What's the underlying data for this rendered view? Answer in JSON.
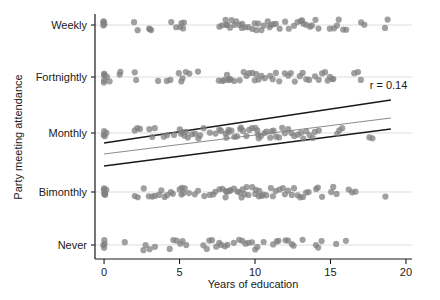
{
  "chart_data": {
    "type": "scatter",
    "title": "",
    "xlabel": "Years of education",
    "ylabel": "Party meeting attendance",
    "xlim": [
      -0.6,
      20.4
    ],
    "xticks": [
      0,
      5,
      10,
      15,
      20
    ],
    "xticklabels": [
      "0",
      "5",
      "10",
      "15",
      "20"
    ],
    "yticklabels": [
      "Weekly",
      "Fortnightly",
      "Monthly",
      "Bimonthly",
      "Never"
    ],
    "ycategories": [
      {
        "label": "Weekly",
        "code": 5
      },
      {
        "label": "Fortnightly",
        "code": 4
      },
      {
        "label": "Monthly",
        "code": 3
      },
      {
        "label": "Bimonthly",
        "code": 2
      },
      {
        "label": "Never",
        "code": 1
      }
    ],
    "grid": "horizontal-light",
    "legend": "none",
    "annotations": [
      {
        "text": "r = 0.14",
        "x": 17.6,
        "y_px": 89
      }
    ],
    "marker": {
      "shape": "circle",
      "color": "#808080",
      "opacity": 0.75,
      "radius_px": 3.1,
      "jitter": "vertical"
    },
    "lines": [
      {
        "name": "upper-band",
        "color": "#1a1a1a",
        "width": 1.6,
        "x": [
          0,
          19
        ],
        "y_px": [
          143,
          100
        ]
      },
      {
        "name": "fit-line",
        "color": "#8c8c8c",
        "width": 1.1,
        "x": [
          0,
          19
        ],
        "y_px": [
          154,
          118
        ]
      },
      {
        "name": "lower-band",
        "color": "#1a1a1a",
        "width": 1.6,
        "x": [
          0,
          19
        ],
        "y_px": [
          166,
          129
        ]
      }
    ],
    "series": [
      {
        "name": "Weekly",
        "y_category": "Weekly",
        "x": [
          0,
          0,
          0,
          0,
          2,
          2.2,
          3,
          3,
          3.1,
          4.4,
          4.8,
          5,
          5.1,
          5.2,
          5.3,
          7.6,
          7.8,
          8,
          8.1,
          8.2,
          8.3,
          8.4,
          8.6,
          8.8,
          9,
          9.1,
          9.2,
          9.4,
          9.6,
          9.8,
          10,
          10.1,
          10.2,
          10.4,
          10.6,
          10.8,
          11,
          11.1,
          11.2,
          11.4,
          11.6,
          12,
          12.2,
          12.6,
          12.8,
          13,
          13.1,
          13.2,
          13.4,
          13.6,
          13.8,
          14,
          14.2,
          15,
          15.2,
          15.4,
          15.6,
          15.8,
          16,
          17,
          17.2,
          18.6,
          18.8
        ]
      },
      {
        "name": "Fortnightly",
        "y_category": "Fortnightly",
        "x": [
          0,
          0,
          0,
          0,
          0,
          0.2,
          0.4,
          1,
          1.1,
          2,
          2.1,
          3.6,
          4.2,
          4.4,
          5,
          5.1,
          5.2,
          5.4,
          5.6,
          6.2,
          7.6,
          7.8,
          8,
          8.1,
          8.2,
          8.3,
          8.4,
          8.6,
          9,
          9.2,
          9.4,
          9.6,
          9.8,
          10,
          10.1,
          10.2,
          10.4,
          10.6,
          11,
          11.2,
          11.4,
          11.6,
          12,
          12.2,
          12.4,
          12.6,
          13,
          13.2,
          13.4,
          13.6,
          14,
          14.2,
          14.4,
          14.6,
          14.8,
          15,
          15.1,
          15.2,
          16.6,
          16.8,
          17
        ]
      },
      {
        "name": "Monthly",
        "y_category": "Monthly",
        "x": [
          0,
          0,
          0,
          0.2,
          2,
          2.2,
          2.4,
          3,
          3.2,
          3.4,
          4,
          4.2,
          4.6,
          5,
          5.1,
          5.2,
          5.3,
          5.4,
          5.6,
          5.8,
          6,
          6.2,
          6.4,
          6.6,
          7,
          7.4,
          7.6,
          7.8,
          8,
          8.1,
          8.2,
          8.3,
          8.4,
          8.6,
          8.8,
          9,
          9.1,
          9.2,
          9.4,
          9.6,
          9.8,
          10,
          10.1,
          10.2,
          10.3,
          10.4,
          10.6,
          10.8,
          11,
          11.1,
          11.2,
          11.4,
          11.6,
          11.8,
          12,
          12.2,
          12.4,
          12.6,
          12.8,
          13,
          13.2,
          13.4,
          13.6,
          13.8,
          14,
          14.2,
          15.4,
          15.6,
          15.8,
          17.6,
          17.8
        ]
      },
      {
        "name": "Bimonthly",
        "y_category": "Bimonthly",
        "x": [
          0,
          0,
          0,
          0,
          0,
          0.1,
          0.2,
          2,
          2.2,
          2.6,
          3,
          3.2,
          3.4,
          3.6,
          3.8,
          4,
          4.2,
          4.4,
          4.6,
          5,
          5.1,
          5.2,
          5.3,
          5.4,
          5.6,
          6,
          6.2,
          6.6,
          7,
          7.2,
          7.4,
          7.6,
          7.8,
          8,
          8.1,
          8.2,
          8.3,
          8.4,
          8.6,
          8.8,
          9,
          9.1,
          9.2,
          9.3,
          9.4,
          9.6,
          9.8,
          10,
          10.1,
          10.2,
          10.3,
          10.4,
          10.6,
          10.8,
          11,
          11.2,
          11.4,
          11.6,
          11.8,
          12,
          12.2,
          12.4,
          12.6,
          12.8,
          13,
          13.2,
          13.4,
          13.6,
          14,
          14.2,
          14.4,
          15,
          15.2,
          15.4,
          16.2,
          16.4,
          16.6,
          18.6
        ]
      },
      {
        "name": "Never",
        "y_category": "Never",
        "x": [
          0,
          0,
          0,
          0,
          1.4,
          2.6,
          2.8,
          3,
          3.4,
          4.4,
          4.6,
          4.8,
          5,
          5.2,
          5.4,
          6.6,
          6.8,
          7,
          7.2,
          7.4,
          7.6,
          7.8,
          8,
          8.2,
          8.6,
          9,
          9.2,
          9.4,
          9.6,
          9.8,
          10,
          10.2,
          10.6,
          11.2,
          11.4,
          11.6,
          12,
          12.2,
          12.4,
          12.6,
          13.2,
          14,
          14.2,
          14.4,
          15.4,
          16
        ]
      }
    ]
  },
  "axes": {
    "x_axis_label": "Years of education",
    "y_axis_label": "Party meeting attendance"
  }
}
